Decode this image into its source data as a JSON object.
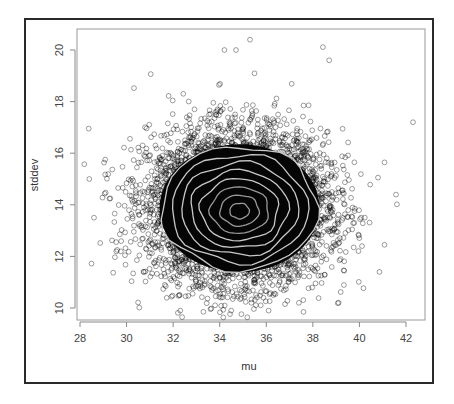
{
  "chart_data": {
    "type": "scatter",
    "title": "",
    "xlabel": "mu",
    "ylabel": "stddev",
    "xlim": [
      28,
      42
    ],
    "ylim": [
      10,
      20
    ],
    "xticks": [
      28,
      30,
      32,
      34,
      36,
      38,
      40,
      42
    ],
    "yticks": [
      10,
      12,
      14,
      16,
      18,
      20
    ],
    "grid": false,
    "legend": null,
    "series": [
      {
        "name": "samples",
        "marker": "open-circle",
        "distribution": {
          "x_mean": 34.8,
          "x_sd": 1.9,
          "y_mean": 13.9,
          "y_sd": 1.45,
          "n": 6000
        },
        "notable_points": [
          {
            "x": 35.3,
            "y": 20.4
          },
          {
            "x": 42.3,
            "y": 17.2
          },
          {
            "x": 36.1,
            "y": 9.9
          },
          {
            "x": 28.4,
            "y": 15.0
          },
          {
            "x": 28.6,
            "y": 13.5
          },
          {
            "x": 37.4,
            "y": 10.2
          },
          {
            "x": 38.7,
            "y": 19.6
          },
          {
            "x": 34.2,
            "y": 20.0
          },
          {
            "x": 34.7,
            "y": 20.0
          }
        ]
      }
    ],
    "overlay": {
      "type": "contour",
      "color": "#c8c8c8",
      "levels": 8,
      "center": {
        "x": 34.85,
        "y": 13.75
      },
      "outer_extent": {
        "x": [
          31.5,
          38.2
        ],
        "y": [
          11.6,
          16.4
        ]
      }
    }
  },
  "colors": {
    "points": "#000000",
    "contours": "#c8c8c8",
    "frame": "#2a2a2a",
    "plot_box": "#999999"
  }
}
